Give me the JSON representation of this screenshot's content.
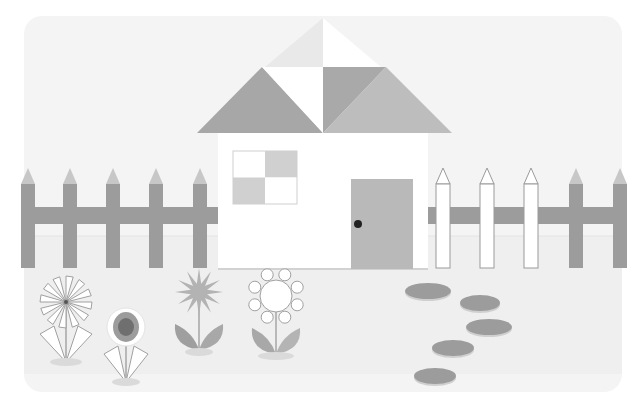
{
  "scene": {
    "title": "House with fence and flowers",
    "panel": {
      "x": 24,
      "y": 16,
      "w": 598,
      "h": 376,
      "r": 18,
      "fill": "#f4f4f4"
    },
    "ground": {
      "y": 236,
      "fill": "#efefef",
      "line": "#e4e4e4"
    },
    "colors": {
      "gray_dark": "#9c9c9c",
      "gray_mid": "#b0b0b0",
      "gray_light": "#c7c7c7",
      "gray_pale": "#e7e7e7",
      "white": "#ffffff",
      "outline": "#b5b5b5",
      "knob": "#222222",
      "shadow": "#dadada"
    },
    "house": {
      "roof": {
        "apex": [
          323,
          18
        ],
        "left": [
          197,
          133
        ],
        "right": [
          452,
          133
        ],
        "mid_y": 78,
        "pieces": [
          {
            "name": "roof-top-left",
            "points": "323,18 252,78 323,78",
            "fill": "#e9e9e9"
          },
          {
            "name": "roof-top-right",
            "points": "323,18 394,78 323,78",
            "fill": "#ffffff"
          },
          {
            "name": "roof-left",
            "points": "197,133 262,67 323,133",
            "fill": "#a7a7a7"
          },
          {
            "name": "roof-center-white",
            "points": "262,67 323,67 323,133",
            "fill": "#ffffff"
          },
          {
            "name": "roof-center-dark",
            "points": "323,67 386,67 323,133",
            "fill": "#a9a9a9"
          },
          {
            "name": "roof-right",
            "points": "386,67 452,133 323,133",
            "fill": "#bdbdbd"
          }
        ]
      },
      "wall": {
        "x": 218,
        "y": 133,
        "w": 210,
        "h": 136,
        "fill": "#ffffff"
      },
      "window": {
        "x": 233,
        "y": 151,
        "w": 64,
        "h": 53
      },
      "door": {
        "x": 351,
        "y": 179,
        "w": 62,
        "h": 90,
        "fill": "#b9b9b9",
        "knob": [
          358,
          224
        ]
      }
    },
    "fence": {
      "rail_y": 207,
      "rail_h": 17,
      "picket_top": 168,
      "picket_bottom": 268,
      "picket_w": 14,
      "tip_h": 16,
      "left_pickets": [
        28,
        70,
        113,
        156,
        200
      ],
      "right_pickets_white": [
        443,
        487,
        531
      ],
      "right_pickets_gray": [
        576,
        620
      ],
      "rail_segments": [
        [
          24,
          218
        ],
        [
          428,
          622
        ]
      ]
    },
    "flowers": [
      {
        "name": "pinwheel-flower",
        "cx": 66,
        "cy": 302,
        "stem_bottom": 362
      },
      {
        "name": "sunflower",
        "cx": 126,
        "cy": 327,
        "stem_bottom": 382
      },
      {
        "name": "star-flower",
        "cx": 199,
        "cy": 292,
        "stem_bottom": 352
      },
      {
        "name": "ring-flower",
        "cx": 276,
        "cy": 296,
        "stem_bottom": 356
      }
    ],
    "stones": [
      {
        "cx": 428,
        "cy": 291,
        "rx": 23,
        "ry": 8
      },
      {
        "cx": 480,
        "cy": 303,
        "rx": 20,
        "ry": 8
      },
      {
        "cx": 489,
        "cy": 327,
        "rx": 23,
        "ry": 8
      },
      {
        "cx": 453,
        "cy": 348,
        "rx": 21,
        "ry": 8
      },
      {
        "cx": 435,
        "cy": 376,
        "rx": 21,
        "ry": 8
      }
    ]
  }
}
